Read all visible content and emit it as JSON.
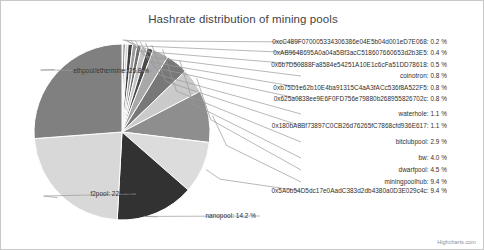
{
  "chart_data": {
    "type": "pie",
    "title": "Hashrate distribution of mining pools",
    "xlabel": "",
    "ylabel": "",
    "legend": "none",
    "grid": false,
    "value_suffix": "%",
    "categories": [
      "0xcC489F070005334306386e04E5b04d001eD7E068",
      "0xAB9648695A0a04a5Bf3acC518607660653d2b3E5",
      "0x6b7D50888Fa8584e54251A10E1c6cFa51DD78618",
      "coinotron",
      "0xb75D1e62b10E4ba91315C4aA3fACc536f8A522F5",
      "0x625a0838ee9E6F0FD756e79880b268955826702c",
      "waterhole",
      "0x180bA8Bf73897C0CB26d76265fC7868cfd936E617",
      "bitclubpool",
      "bw",
      "dwarfpool",
      "miningpoolhub",
      "0x5A0b54D5dc17e0AadC383d2db4380a0D3E029c4c",
      "nanopool",
      "f2pool",
      "ethpool/ethermine"
    ],
    "values": [
      0.2,
      0.4,
      0.5,
      0.8,
      0.8,
      0.8,
      1.1,
      1.1,
      2.9,
      4.0,
      4.5,
      9.4,
      9.4,
      14.2,
      22.6,
      25.8
    ],
    "slices": [
      {
        "label": "0xcC489F070005334306386e04E5b04d001eD7E068: 0.2 %",
        "name": "0xcC489F070005334306386e04E5b04d001eD7E068",
        "value": 0.2,
        "color": "#b0b0b0"
      },
      {
        "label": "0xAB9648695A0a04a5Bf3acC518607660653d2b3E5: 0.4 %",
        "name": "0xAB9648695A0a04a5Bf3acC518607660653d2b3E5",
        "value": 0.4,
        "color": "#5e5e5e"
      },
      {
        "label": "0x6b7D50888Fa8584e54251A10E1c6cFa51DD78618: 0.5 %",
        "name": "0x6b7D50888Fa8584e54251A10E1c6cFa51DD78618",
        "value": 0.5,
        "color": "#d2d2d2"
      },
      {
        "label": "coinotron: 0.8 %",
        "name": "coinotron",
        "value": 0.8,
        "color": "#3f3f3f"
      },
      {
        "label": "0xb75D1e62b10E4ba91315C4aA3fACc536f8A522F5: 0.8 %",
        "name": "0xb75D1e62b10E4ba91315C4aA3fACc536f8A522F5",
        "value": 0.8,
        "color": "#9a9a9a"
      },
      {
        "label": "0x625a0838ee9E6F0FD756e79880b268955826702c: 0.8 %",
        "name": "0x625a0838ee9E6F0FD756e79880b268955826702c",
        "value": 0.8,
        "color": "#6e6e6e"
      },
      {
        "label": "waterhole: 1.1 %",
        "name": "waterhole",
        "value": 1.1,
        "color": "#c4c4c4"
      },
      {
        "label": "0x180bA8Bf73897C0CB26d76265fC7868cfd936E617: 1.1 %",
        "name": "0x180bA8Bf73897C0CB26d76265fC7868cfd936E617",
        "value": 1.1,
        "color": "#4a4a4a"
      },
      {
        "label": "bitclubpool: 2.9 %",
        "name": "bitclubpool",
        "value": 2.9,
        "color": "#a8a8a8"
      },
      {
        "label": "bw: 4.0 %",
        "name": "bw",
        "value": 4.0,
        "color": "#787878"
      },
      {
        "label": "dwarfpool: 4.5 %",
        "name": "dwarfpool",
        "value": 4.5,
        "color": "#cacaca"
      },
      {
        "label": "miningpoolhub: 9.4 %",
        "name": "miningpoolhub",
        "value": 9.4,
        "color": "#8e8e8e"
      },
      {
        "label": "0x5A0b54D5dc17e0AadC383d2db4380a0D3E029c4c: 9.4 %",
        "name": "0x5A0b54D5dc17e0AadC383d2db4380a0D3E029c4c",
        "value": 9.4,
        "color": "#dcdcdc"
      },
      {
        "label": "nanopool: 14.2 %",
        "name": "nanopool",
        "value": 14.2,
        "color": "#323232"
      },
      {
        "label": "f2pool: 22.6 %",
        "name": "f2pool",
        "value": 22.6,
        "color": "#d8d8d8"
      },
      {
        "label": "ethpool/ethermine: 25.8 %",
        "name": "ethpool/ethermine",
        "value": 25.8,
        "color": "#808080"
      }
    ]
  },
  "credit": "Highcharts.com"
}
